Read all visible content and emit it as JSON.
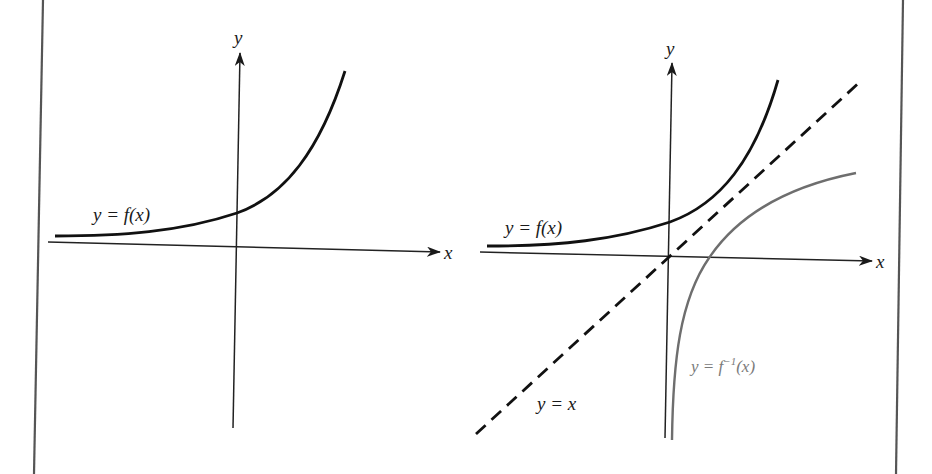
{
  "figure": {
    "panels": [
      {
        "id": "left",
        "axis_labels": {
          "x": "x",
          "y": "y"
        },
        "curves": [
          {
            "name": "f",
            "label": "y = f(x)",
            "style": "solid",
            "color": "#111111"
          }
        ]
      },
      {
        "id": "right",
        "axis_labels": {
          "x": "x",
          "y": "y"
        },
        "curves": [
          {
            "name": "f",
            "label": "y = f(x)",
            "style": "solid",
            "color": "#111111"
          },
          {
            "name": "identity",
            "label": "y = x",
            "style": "dashed",
            "color": "#111111"
          },
          {
            "name": "f-inverse",
            "label_prefix": "y = f",
            "label_sup": "−1",
            "label_suffix": "(x)",
            "style": "solid",
            "color": "#6e6e6e"
          }
        ]
      }
    ],
    "colors": {
      "background": "#ffffff",
      "border": "#555555",
      "axis": "#222222",
      "curve": "#111111",
      "inverse_curve": "#6e6e6e"
    }
  }
}
